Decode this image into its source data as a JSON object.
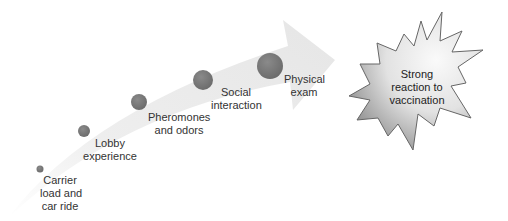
{
  "diagram": {
    "type": "process-arrow",
    "steps": [
      {
        "label_line1": "Carrier",
        "label_line2": "load and",
        "label_line3": "car ride"
      },
      {
        "label_line1": "Lobby",
        "label_line2": "experience"
      },
      {
        "label_line1": "Pheromones",
        "label_line2": "and odors"
      },
      {
        "label_line1": "Social",
        "label_line2": "interaction"
      },
      {
        "label_line1": "Physical",
        "label_line2": "exam"
      }
    ],
    "outcome": {
      "line1": "Strong",
      "line2": "reaction to",
      "line3": "vaccination"
    },
    "colors": {
      "arrow": "#ececec",
      "circle": "#7a7a7a",
      "burst_light": "#f4f4f4",
      "burst_dark": "#9a9a9a",
      "burst_stroke": "#666666"
    }
  }
}
